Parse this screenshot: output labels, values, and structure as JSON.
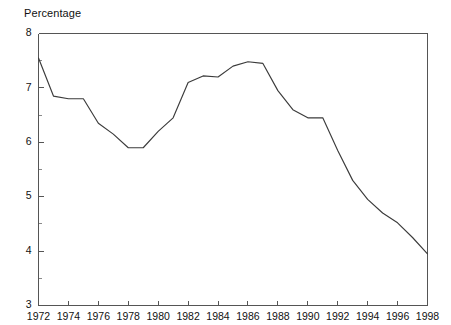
{
  "chart_data": {
    "type": "line",
    "title": "Percentage",
    "xlabel": "",
    "ylabel": "",
    "grid": false,
    "legend": false,
    "xlim": [
      1972,
      1998
    ],
    "ylim": [
      3,
      8
    ],
    "y_ticks": [
      3,
      4,
      5,
      6,
      7,
      8
    ],
    "y_tick_labels": [
      "3",
      "4",
      "5",
      "6",
      "7",
      "8"
    ],
    "y_minor_ticks": [
      3.5,
      4.5,
      5.5,
      6.5,
      7.5
    ],
    "x_ticks": [
      1972,
      1974,
      1976,
      1978,
      1980,
      1982,
      1984,
      1986,
      1988,
      1990,
      1992,
      1994,
      1996,
      1998
    ],
    "x_tick_labels": [
      "1972",
      "1974",
      "1976",
      "1978",
      "1980",
      "1982",
      "1984",
      "1986",
      "1988",
      "1990",
      "1992",
      "1994",
      "1996",
      "1998"
    ],
    "line_color": "#3b3b3b",
    "axis_color": "#555555",
    "series": [
      {
        "name": "Percentage",
        "x": [
          1972,
          1973,
          1974,
          1975,
          1976,
          1977,
          1978,
          1979,
          1980,
          1981,
          1982,
          1983,
          1984,
          1985,
          1986,
          1987,
          1988,
          1989,
          1990,
          1991,
          1992,
          1993,
          1994,
          1995,
          1996,
          1997,
          1998
        ],
        "values": [
          7.55,
          6.85,
          6.8,
          6.8,
          6.35,
          6.15,
          5.9,
          5.9,
          6.2,
          6.45,
          7.1,
          7.22,
          7.2,
          7.4,
          7.48,
          7.45,
          6.95,
          6.6,
          6.45,
          6.45,
          5.85,
          5.3,
          4.95,
          4.7,
          4.52,
          4.25,
          3.95
        ]
      }
    ]
  },
  "axes": {
    "title_text": "Percentage"
  }
}
